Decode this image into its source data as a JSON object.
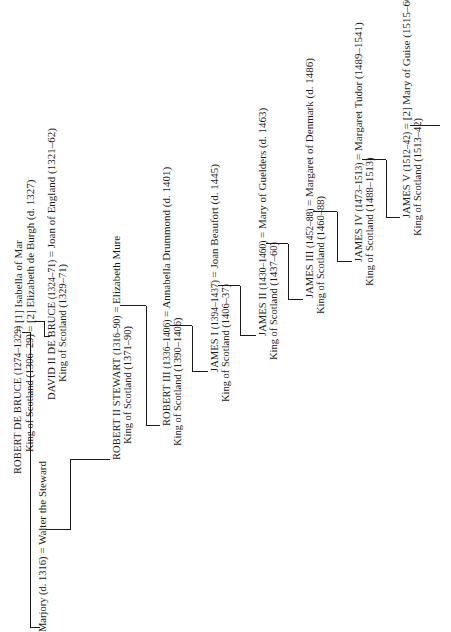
{
  "diagram": {
    "type": "genealogy",
    "orientation": "rotated-90-ccw",
    "people": {
      "robert_de_bruce": {
        "name": "ROBERT DE BRUCE",
        "dates": "(1274–1329)",
        "title": "King of Scotland (1306–29)",
        "spouses": [
          "= [1] Isabella of Mar",
          "= [2] Elizabeth de Burgh (d. 1327)"
        ]
      },
      "marjory": {
        "name": "Marjory (d. 1316)",
        "spouse": "= Walter the Steward"
      },
      "david_ii": {
        "name": "DAVID II DE BRUCE",
        "dates": "(1324–71)",
        "title": "King of Scotland (1329–71)",
        "spouse": "= Joan of England (1321–62)"
      },
      "robert_ii": {
        "name": "ROBERT II STEWART",
        "dates": "(1316–90)",
        "title": "King of Scotland (1371–90)",
        "spouse": "= Elizabeth Mure"
      },
      "robert_iii": {
        "name": "ROBERT III",
        "dates": "(1336–1406)",
        "title": "King of Scotland (1390–1406)",
        "spouse": "= Annabella Drummond (d. 1401)"
      },
      "james_i": {
        "name": "JAMES I",
        "dates": "(1394–1437)",
        "title": "King of Scotland (1406–37)",
        "spouse": "= Joan Beaufort (d. 1445)"
      },
      "james_ii": {
        "name": "JAMES II",
        "dates": "(1430–1460)",
        "title": "King of Scotland (1437–60)",
        "spouse": "= Mary of Guelders (d. 1463)"
      },
      "james_iii": {
        "name": "JAMES III",
        "dates": "(1452–88)",
        "title": "King of Scotland (1460–88)",
        "spouse": "= Margaret of Denmark (d. 1486)"
      },
      "james_iv": {
        "name": "JAMES IV",
        "dates": "(1473–1513)",
        "title": "King of Scotland (1488–1513)",
        "spouse": "= Margaret Tudor (1489–1541)"
      },
      "james_v": {
        "name": "JAMES V",
        "dates": "(1512–42)",
        "title": "King of Scotland (1513–42)",
        "spouse": "= [2] Mary of Guise (1515–60)"
      }
    }
  }
}
